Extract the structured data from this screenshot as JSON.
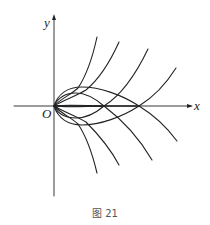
{
  "figure": {
    "caption": "图 21",
    "axes": {
      "x_label": "x",
      "y_label": "y",
      "origin_label": "O"
    },
    "colors": {
      "stroke": "#222222",
      "background": "#ffffff",
      "caption": "#555555"
    },
    "curves": {
      "closed_loops": [
        {
          "name": "inner-loop",
          "from": [
            54,
            106
          ],
          "to": [
            104,
            106
          ],
          "top_y": 93,
          "bottom_y": 118
        },
        {
          "name": "outer-loop",
          "from": [
            54,
            106
          ],
          "to": [
            139,
            106
          ],
          "top_y": 87,
          "bottom_y": 125
        }
      ],
      "upper_branches": [
        {
          "name": "upper-branch-1",
          "end": [
            97,
            37
          ]
        },
        {
          "name": "upper-branch-2",
          "end": [
            119,
            42
          ]
        },
        {
          "name": "upper-branch-3",
          "end": [
            148,
            49
          ]
        },
        {
          "name": "upper-branch-4",
          "end": [
            176,
            68
          ]
        }
      ],
      "lower_branches": [
        {
          "name": "lower-branch-1",
          "end": [
            97,
            173
          ]
        },
        {
          "name": "lower-branch-2",
          "end": [
            119,
            165
          ]
        },
        {
          "name": "lower-branch-3",
          "end": [
            152,
            160
          ]
        },
        {
          "name": "lower-branch-4",
          "end": [
            177,
            141
          ]
        }
      ]
    }
  }
}
